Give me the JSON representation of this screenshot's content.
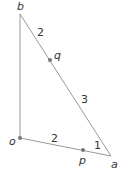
{
  "diagram": {
    "points": {
      "b": {
        "label": "b",
        "x": 20,
        "y": 14
      },
      "o": {
        "label": "o",
        "x": 20,
        "y": 138
      },
      "a": {
        "label": "a",
        "x": 111,
        "y": 156
      },
      "q": {
        "label": "q",
        "x": 50,
        "y": 60
      },
      "p": {
        "label": "p",
        "x": 83,
        "y": 150
      }
    },
    "segment_labels": {
      "bq": "2",
      "qa": "3",
      "op": "2",
      "pa": "1"
    },
    "colors": {
      "line": "#999999",
      "point": "#777777",
      "text": "#333333"
    }
  }
}
